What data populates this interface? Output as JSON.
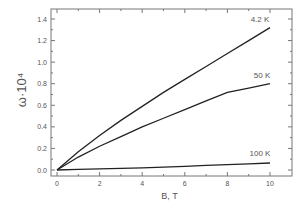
{
  "chart_data": {
    "type": "line",
    "title": "",
    "xlabel": "B, T",
    "ylabel": "ω·10⁴",
    "xlim": [
      -0.5,
      11
    ],
    "ylim": [
      -0.05,
      1.5
    ],
    "xticks": [
      0,
      2,
      4,
      6,
      8,
      10
    ],
    "yticks": [
      0.0,
      0.2,
      0.4,
      0.6,
      0.8,
      1.0,
      1.2,
      1.4
    ],
    "grid": false,
    "series": [
      {
        "name": "4.2 K",
        "x": [
          0,
          1,
          2,
          3,
          4,
          5,
          6,
          7,
          8,
          9,
          10
        ],
        "values": [
          0,
          0.17,
          0.32,
          0.46,
          0.59,
          0.72,
          0.84,
          0.96,
          1.08,
          1.2,
          1.32
        ]
      },
      {
        "name": "50 K",
        "x": [
          0,
          1,
          2,
          3,
          4,
          5,
          6,
          7,
          8,
          9,
          10
        ],
        "values": [
          0,
          0.12,
          0.22,
          0.31,
          0.4,
          0.48,
          0.56,
          0.64,
          0.72,
          0.76,
          0.8
        ]
      },
      {
        "name": "100 K",
        "x": [
          0,
          1,
          2,
          3,
          4,
          5,
          6,
          7,
          8,
          9,
          10
        ],
        "values": [
          0,
          0.005,
          0.01,
          0.015,
          0.02,
          0.027,
          0.034,
          0.042,
          0.05,
          0.057,
          0.065
        ]
      }
    ]
  }
}
